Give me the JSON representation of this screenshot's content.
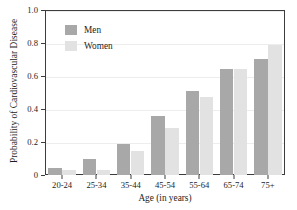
{
  "chart_data": {
    "type": "bar",
    "title": "",
    "xlabel": "Age (in years)",
    "ylabel": "Probability of Cardiovascular Disease",
    "categories": [
      "20-24",
      "25-34",
      "35-44",
      "45-54",
      "55-64",
      "65-74",
      "75+"
    ],
    "series": [
      {
        "name": "Men",
        "color": "#a8a8a8",
        "values": [
          0.04,
          0.1,
          0.185,
          0.355,
          0.51,
          0.64,
          0.705
        ]
      },
      {
        "name": "Women",
        "color": "#e2e2e2",
        "values": [
          0.03,
          0.03,
          0.145,
          0.285,
          0.47,
          0.64,
          0.785
        ]
      }
    ],
    "ylim": [
      0,
      1.0
    ],
    "ytick_values": [
      0,
      0.2,
      0.4,
      0.6,
      0.8,
      1.0
    ],
    "ytick_labels": [
      "0",
      "0.2",
      "0.4",
      "0.6",
      "0.8",
      "1.0"
    ],
    "grid": true,
    "grid_axis": "y",
    "legend_position": "upper-left-inside",
    "frame_color": "#3c3c3c",
    "grid_color": "#ededed",
    "background": "#ffffff"
  }
}
